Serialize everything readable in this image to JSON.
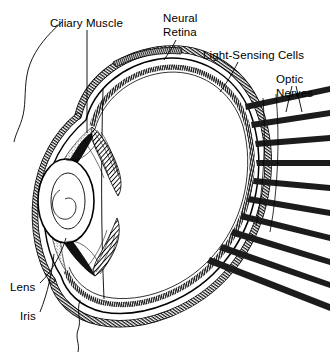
{
  "figure": {
    "background_color": "#ffffff",
    "ink_color": "#000000",
    "width": 330,
    "height": 353
  },
  "labels": [
    {
      "id": "ciliary-muscle",
      "text": "Ciliary Muscle",
      "lines": [
        "Ciliary Muscle"
      ],
      "x": 50,
      "y": 24,
      "anchor": "start"
    },
    {
      "id": "neural-retina",
      "text": "Neural Retina",
      "lines": [
        "Neural",
        "Retina"
      ],
      "x": 163,
      "y": 20,
      "anchor": "start"
    },
    {
      "id": "light-sensing-cells",
      "text": "Light-Sensing Cells",
      "lines": [
        "Light-Sensing Cells"
      ],
      "x": 203,
      "y": 56,
      "anchor": "start"
    },
    {
      "id": "optic-nerves",
      "text": "Optic Nerves",
      "lines": [
        "Optic",
        "Nerves"
      ],
      "x": 276,
      "y": 80,
      "anchor": "start"
    },
    {
      "id": "lens",
      "text": "Lens",
      "lines": [
        "Lens"
      ],
      "x": 10,
      "y": 288,
      "anchor": "start"
    },
    {
      "id": "iris",
      "text": "Iris",
      "lines": [
        "Iris"
      ],
      "x": 20,
      "y": 317,
      "anchor": "start"
    }
  ],
  "label_lines": {
    "ciliary_muscle_l1": "Ciliary Muscle",
    "neural_retina_l1": "Neural",
    "neural_retina_l2": "Retina",
    "light_sensing_l1": "Light-Sensing Cells",
    "optic_nerves_l1": "Optic",
    "optic_nerves_l2": "Nerves",
    "lens_l1": "Lens",
    "iris_l1": "Iris"
  },
  "structures": [
    {
      "id": "sclera",
      "name": "sclera-outer-coat"
    },
    {
      "id": "choroid",
      "name": "choroid-layer"
    },
    {
      "id": "neural-retina",
      "name": "neural-retina-layer"
    },
    {
      "id": "cornea",
      "name": "cornea"
    },
    {
      "id": "lens",
      "name": "crystalline-lens"
    },
    {
      "id": "iris",
      "name": "iris"
    },
    {
      "id": "ciliary-body",
      "name": "ciliary-body-muscle"
    },
    {
      "id": "vitreous",
      "name": "vitreous-chamber"
    },
    {
      "id": "optic-nerve-bundle",
      "name": "optic-nerve-fiber-bundles",
      "count": 10
    },
    {
      "id": "face-contour",
      "name": "facial-profile-contour"
    }
  ],
  "optic_nerve_bands": [
    {
      "index": 1,
      "y_start": 104,
      "y_end": 88
    },
    {
      "index": 2,
      "y_start": 121,
      "y_end": 112
    },
    {
      "index": 3,
      "y_start": 140,
      "y_end": 137
    },
    {
      "index": 4,
      "y_start": 159,
      "y_end": 161
    },
    {
      "index": 5,
      "y_start": 177,
      "y_end": 185
    },
    {
      "index": 6,
      "y_start": 195,
      "y_end": 209
    },
    {
      "index": 7,
      "y_start": 212,
      "y_end": 233
    },
    {
      "index": 8,
      "y_start": 228,
      "y_end": 256
    },
    {
      "index": 9,
      "y_start": 243,
      "y_end": 279
    },
    {
      "index": 10,
      "y_start": 256,
      "y_end": 300
    }
  ]
}
